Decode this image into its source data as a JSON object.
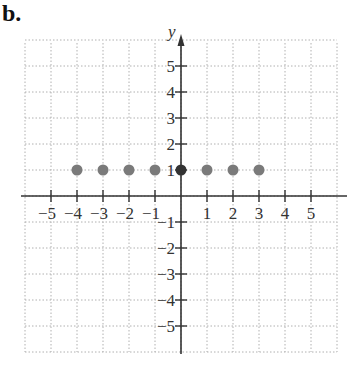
{
  "part_label": "b.",
  "chart_data": {
    "type": "scatter",
    "title": "",
    "xlabel": "x",
    "ylabel": "y",
    "xlim": [
      -6,
      6
    ],
    "ylim": [
      -6,
      6
    ],
    "grid": true,
    "x_ticks": [
      -5,
      -4,
      -3,
      -2,
      -1,
      1,
      2,
      3,
      4,
      5
    ],
    "y_ticks": [
      5,
      4,
      3,
      2,
      1,
      -1,
      -2,
      -3,
      -4,
      -5
    ],
    "x_tick_labels": [
      "−5",
      "−4",
      "−3",
      "−2",
      "−1",
      "1",
      "2",
      "3",
      "4",
      "5"
    ],
    "y_tick_labels": [
      "5",
      "4",
      "3",
      "2",
      "1",
      "−1",
      "−2",
      "−3",
      "−4",
      "−5"
    ],
    "points": [
      {
        "x": -4,
        "y": 1
      },
      {
        "x": -3,
        "y": 1
      },
      {
        "x": -2,
        "y": 1
      },
      {
        "x": -1,
        "y": 1
      },
      {
        "x": 0,
        "y": 1
      },
      {
        "x": 1,
        "y": 1
      },
      {
        "x": 2,
        "y": 1
      },
      {
        "x": 3,
        "y": 1
      }
    ],
    "point_color": "#7a7a7a",
    "axis_color": "#333333",
    "grid_color": "#b0b0b0"
  }
}
